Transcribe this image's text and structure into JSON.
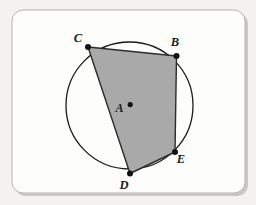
{
  "figure": {
    "canvas": {
      "width": 256,
      "height": 205
    },
    "background_color": "#f3f2f0",
    "card": {
      "x": 12,
      "y": 10,
      "width": 233,
      "height": 183,
      "corner_radius": 11,
      "fill_color": "#fdfdfc",
      "border_color": "#b9b9b7",
      "shadow_color": "#9a9a98"
    },
    "circle": {
      "label": "circle-A",
      "center_x": 129.5,
      "center_y": 105.5,
      "radius": 63.5,
      "stroke_color": "#1a1a1a",
      "stroke_width": 1.3,
      "fill_color": "none"
    },
    "center_point": {
      "name": "A",
      "label": "A",
      "x": 130.2,
      "y": 104.6,
      "dot_radius": 2.6,
      "dot_color": "#111111",
      "label_x": 119.5,
      "label_y": 112.0
    },
    "polygon": {
      "name": "quadrilateral-CBED",
      "vertex_order": [
        "C",
        "B",
        "E",
        "D"
      ],
      "fill_color": "#a9a9a9",
      "fill_opacity": 1,
      "stroke_color": "#2b2b2b",
      "stroke_width": 1.4,
      "points": "88,47 176.5,56 175,152 130,173.5"
    },
    "vertices": [
      {
        "name": "C",
        "label": "C",
        "x": 88.0,
        "y": 47.0,
        "dot_radius": 3.0,
        "dot_color": "#111111",
        "label_x": 78.0,
        "label_y": 42.0
      },
      {
        "name": "B",
        "label": "B",
        "x": 176.5,
        "y": 56.0,
        "dot_radius": 3.0,
        "dot_color": "#111111",
        "label_x": 175.0,
        "label_y": 46.0
      },
      {
        "name": "E",
        "label": "E",
        "x": 175.0,
        "y": 152.0,
        "dot_radius": 3.0,
        "dot_color": "#111111",
        "label_x": 181.0,
        "label_y": 162.5
      },
      {
        "name": "D",
        "label": "D",
        "x": 130.0,
        "y": 173.5,
        "dot_radius": 3.0,
        "dot_color": "#111111",
        "label_x": 124.0,
        "label_y": 189.0
      }
    ],
    "edges": [
      {
        "name": "chord-CB",
        "from": "C",
        "to": "B"
      },
      {
        "name": "chord-BE",
        "from": "B",
        "to": "E"
      },
      {
        "name": "chord-ED",
        "from": "E",
        "to": "D"
      },
      {
        "name": "chord-DC",
        "from": "D",
        "to": "C"
      }
    ]
  }
}
